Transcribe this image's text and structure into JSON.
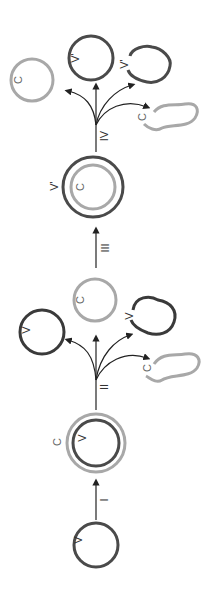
{
  "diagram": {
    "orientation": "rotated-90-ccw",
    "colors": {
      "dark": "#4a4a4a",
      "light": "#a8a8a8",
      "arrow": "#222222"
    },
    "steps": [
      {
        "id": "I",
        "label": "I"
      },
      {
        "id": "II",
        "label": "II"
      },
      {
        "id": "III",
        "label": "III"
      },
      {
        "id": "IV",
        "label": "IV"
      }
    ],
    "nodes": {
      "start": {
        "inner_label": "V"
      },
      "after_I": {
        "outer_label": "C",
        "inner_label": "V"
      },
      "II_outcomes": {
        "v_circle": "V",
        "c_circle": "C",
        "v_blob": "V",
        "c_squiggle": "C"
      },
      "after_III": {
        "outer_label": "V'",
        "inner_label": "C"
      },
      "IV_outcomes": {
        "v_circle": "V'",
        "c_circle": "C",
        "v_blob": "V'",
        "c_squiggle": "C"
      }
    }
  }
}
